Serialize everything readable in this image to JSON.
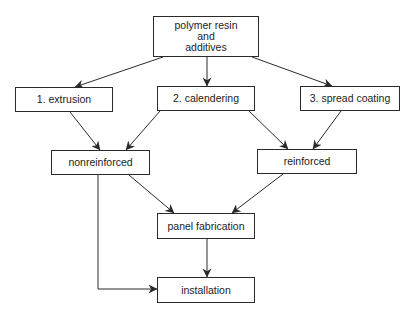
{
  "diagram": {
    "type": "flowchart",
    "nodes": [
      {
        "id": "resin",
        "label": "polymer resin\nand\nadditives",
        "x": 153,
        "y": 16,
        "w": 106,
        "h": 41
      },
      {
        "id": "extrusion",
        "label": "1.  extrusion",
        "x": 15,
        "y": 87,
        "w": 98,
        "h": 25
      },
      {
        "id": "calendering",
        "label": "2.  calendering",
        "x": 157,
        "y": 86,
        "w": 98,
        "h": 25
      },
      {
        "id": "spread",
        "label": "3.  spread coating",
        "x": 300,
        "y": 86,
        "w": 100,
        "h": 25
      },
      {
        "id": "nonreinforced",
        "label": "nonreinforced",
        "x": 51,
        "y": 150,
        "w": 99,
        "h": 25
      },
      {
        "id": "reinforced",
        "label": "reinforced",
        "x": 257,
        "y": 149,
        "w": 100,
        "h": 25
      },
      {
        "id": "panel",
        "label": "panel fabrication",
        "x": 157,
        "y": 213,
        "w": 98,
        "h": 26
      },
      {
        "id": "installation",
        "label": "installation",
        "x": 157,
        "y": 277,
        "w": 98,
        "h": 26
      }
    ],
    "edges": [
      {
        "from": "resin",
        "to": "extrusion"
      },
      {
        "from": "resin",
        "to": "calendering"
      },
      {
        "from": "resin",
        "to": "spread"
      },
      {
        "from": "extrusion",
        "to": "nonreinforced"
      },
      {
        "from": "calendering",
        "to": "nonreinforced"
      },
      {
        "from": "calendering",
        "to": "reinforced"
      },
      {
        "from": "spread",
        "to": "reinforced"
      },
      {
        "from": "nonreinforced",
        "to": "panel"
      },
      {
        "from": "reinforced",
        "to": "panel"
      },
      {
        "from": "panel",
        "to": "installation"
      },
      {
        "from": "nonreinforced",
        "to": "installation"
      }
    ]
  },
  "labels": {
    "resin": "polymer resin\nand\nadditives",
    "extrusion": "1.  extrusion",
    "calendering": "2.  calendering",
    "spread": "3.  spread coating",
    "nonreinforced": "nonreinforced",
    "reinforced": "reinforced",
    "panel": "panel fabrication",
    "installation": "installation"
  },
  "colors": {
    "stroke": "#2a2a2a",
    "background": "#ffffff",
    "text": "#222222"
  }
}
